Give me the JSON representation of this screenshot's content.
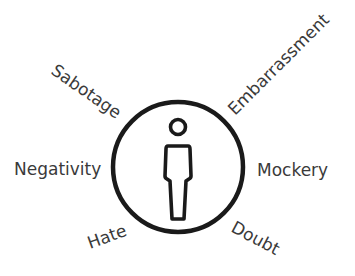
{
  "diagram": {
    "center_icon": "person-icon",
    "colors": {
      "stroke": "#1a1a1a",
      "text": "#3a3a3a",
      "background": "#ffffff"
    },
    "labels": [
      {
        "id": "sabotage",
        "text": "Sabotage"
      },
      {
        "id": "embarrassment",
        "text": "Embarrassment"
      },
      {
        "id": "negativity",
        "text": "Negativity"
      },
      {
        "id": "mockery",
        "text": "Mockery"
      },
      {
        "id": "hate",
        "text": "Hate"
      },
      {
        "id": "doubt",
        "text": "Doubt"
      }
    ]
  }
}
